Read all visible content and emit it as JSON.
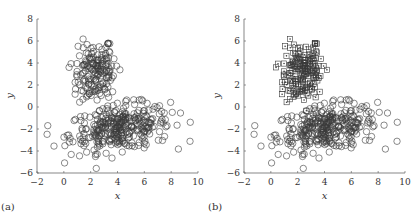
{
  "chart_data": [
    {
      "type": "scatter",
      "panel_label": "(a)",
      "xlabel": "x",
      "ylabel": "y",
      "xlim": [
        -2,
        10
      ],
      "ylim": [
        -6,
        8
      ],
      "xticks": [
        -2,
        0,
        2,
        4,
        6,
        8,
        10
      ],
      "yticks": [
        -6,
        -4,
        -2,
        0,
        2,
        4,
        6,
        8
      ],
      "grid": false,
      "legend": null,
      "series": [
        {
          "name": "all points",
          "marker": "circle",
          "clusters": [
            {
              "cx": 2.4,
              "cy": 3.2,
              "sx": 0.9,
              "sy": 1.3,
              "n": 170,
              "rot": 0.5
            },
            {
              "cx": 4.2,
              "cy": -1.9,
              "sx": 1.9,
              "sy": 1.0,
              "n": 330,
              "rot": 0.15
            }
          ]
        }
      ]
    },
    {
      "type": "scatter",
      "panel_label": "(b)",
      "xlabel": "x",
      "ylabel": "y",
      "xlim": [
        -2,
        10
      ],
      "ylim": [
        -6,
        8
      ],
      "xticks": [
        -2,
        0,
        2,
        4,
        6,
        8,
        10
      ],
      "yticks": [
        -6,
        -4,
        -2,
        0,
        2,
        4,
        6,
        8
      ],
      "grid": false,
      "legend": null,
      "series": [
        {
          "name": "cluster 1",
          "marker": "square-dot",
          "clusters": [
            {
              "cx": 2.4,
              "cy": 3.2,
              "sx": 0.9,
              "sy": 1.3,
              "n": 170,
              "rot": 0.5
            }
          ]
        },
        {
          "name": "cluster 2",
          "marker": "circle",
          "clusters": [
            {
              "cx": 4.2,
              "cy": -1.9,
              "sx": 1.9,
              "sy": 1.0,
              "n": 330,
              "rot": 0.15
            }
          ]
        }
      ]
    }
  ],
  "colors": {
    "marker": "#3a3a3a",
    "axis": "#555555"
  }
}
